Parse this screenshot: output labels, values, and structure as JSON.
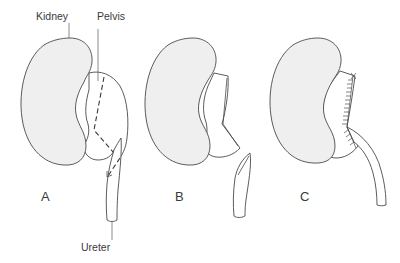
{
  "diagram": {
    "type": "medical-illustration",
    "labels": {
      "kidney": "Kidney",
      "pelvis": "Pelvis",
      "ureter": "Ureter"
    },
    "panels": [
      {
        "id": "A",
        "letter": "A",
        "description": "Kidney with dilated pelvis; dashed line marks incision through pelvis and ureter"
      },
      {
        "id": "B",
        "letter": "B",
        "description": "Pelvis excised and ureter spatulated"
      },
      {
        "id": "C",
        "letter": "C",
        "description": "Ureter anastomosed to pelvis with sutures"
      }
    ],
    "colors": {
      "kidney_fill": "#efefef",
      "line": "#4a4a4a",
      "text": "#3a3a3a",
      "background": "#ffffff"
    }
  }
}
